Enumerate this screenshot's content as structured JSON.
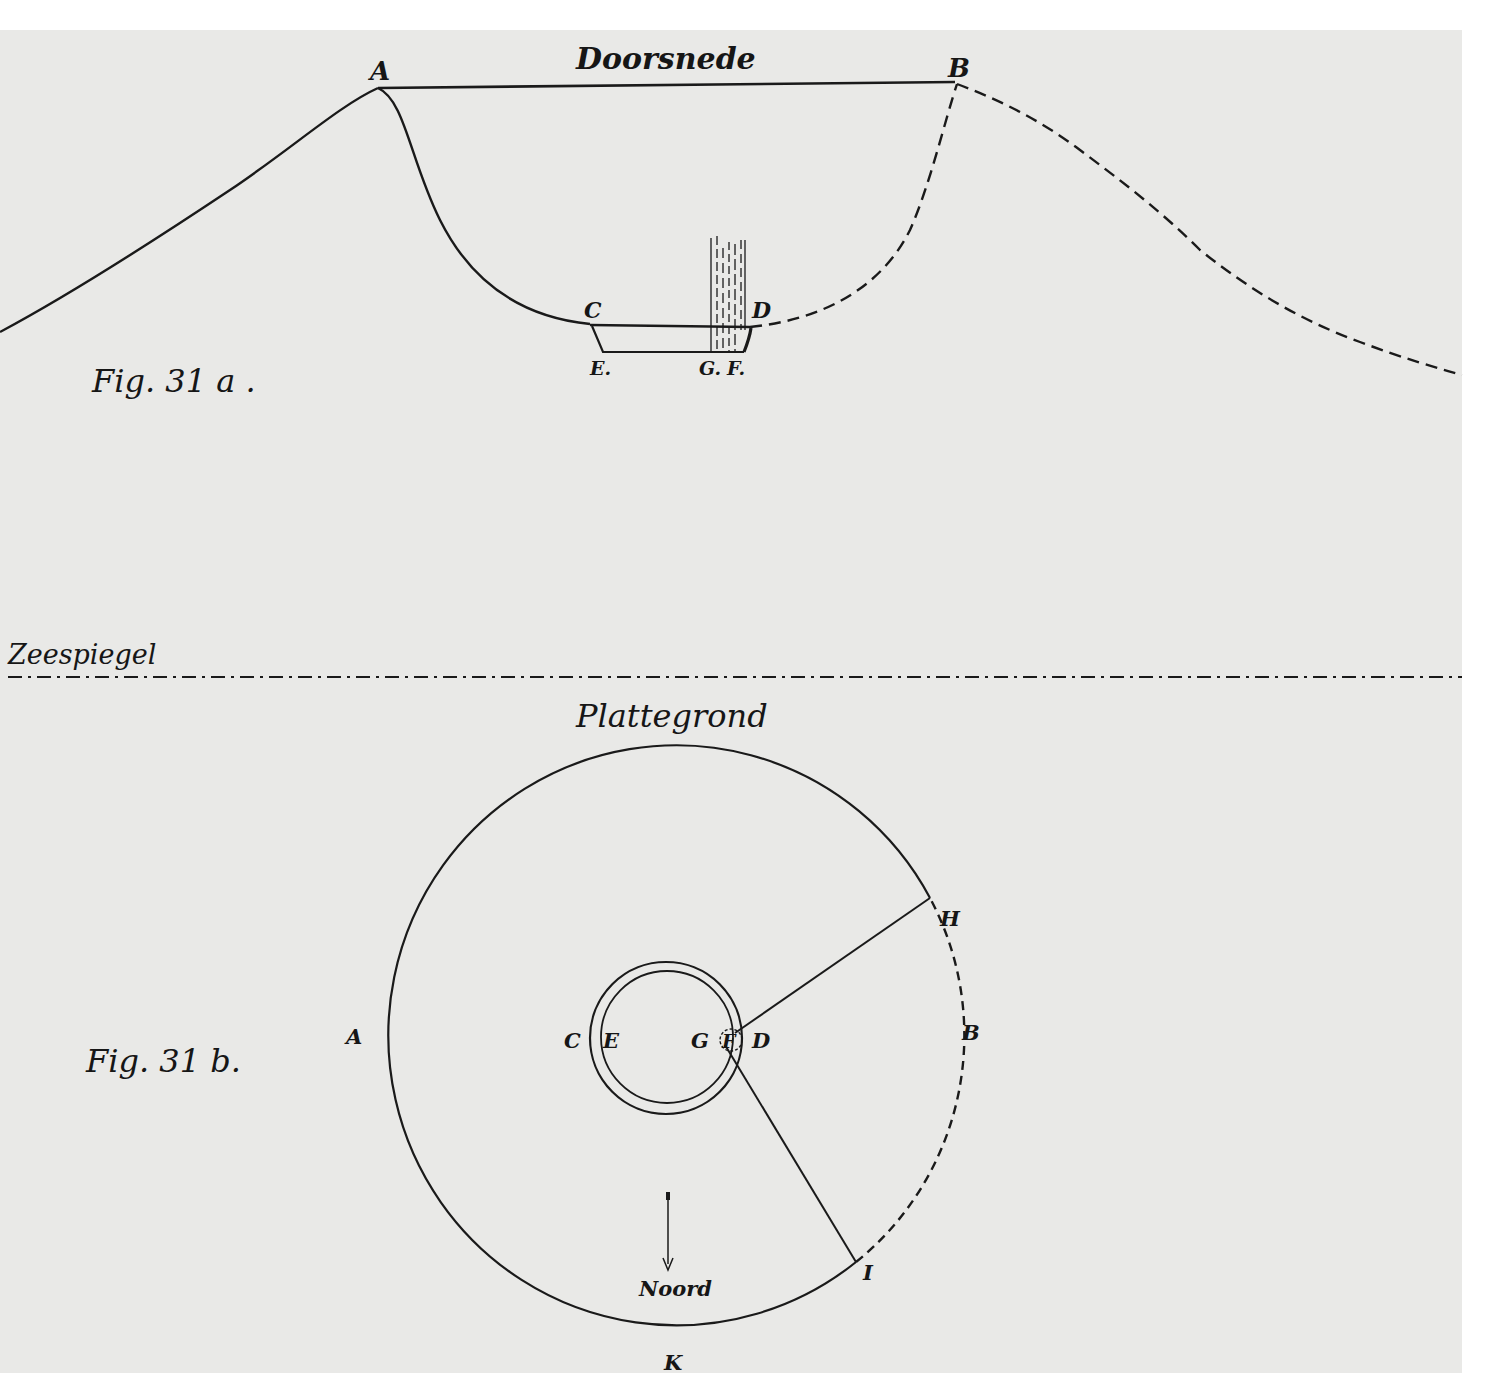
{
  "colors": {
    "paper": "#e9e9e7",
    "margin": "#ffffff",
    "ink": "#1a1a1a"
  },
  "figure_a": {
    "title": "Doorsnede",
    "caption": "Fig. 31 a .",
    "points": {
      "A": "A",
      "B": "B",
      "C": "C",
      "D": "D",
      "E": "E.",
      "G": "G.",
      "F": "F."
    }
  },
  "sea_level": {
    "label": "Zeespiegel"
  },
  "figure_b": {
    "title": "Plattegrond",
    "caption": "Fig. 31 b.",
    "points": {
      "A": "A",
      "B": "B",
      "C": "C",
      "E": "E",
      "G": "G",
      "F": "F",
      "D": "D",
      "H": "H",
      "I": "I",
      "K": "K"
    },
    "north_label": "Noord"
  }
}
